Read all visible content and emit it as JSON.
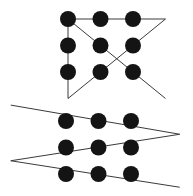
{
  "diagram": {
    "colors": {
      "dot": "#141414",
      "line": "#3a3a3a",
      "background": "#ffffff"
    },
    "puzzles": [
      {
        "name": "four-line-solution",
        "grid": {
          "rows": 3,
          "cols": 3
        },
        "path_in_grid_units": [
          [
            0,
            0
          ],
          [
            3,
            0
          ],
          [
            0,
            3
          ],
          [
            0,
            0
          ],
          [
            3,
            3
          ]
        ],
        "line_count": 4
      },
      {
        "name": "three-line-solution",
        "grid": {
          "rows": 3,
          "cols": 3
        },
        "path_in_grid_units": [
          [
            -1.7,
            -0.6
          ],
          [
            3.5,
            0.5
          ],
          [
            -1.7,
            1.5
          ],
          [
            3.5,
            2.5
          ]
        ],
        "line_count": 3
      }
    ]
  }
}
